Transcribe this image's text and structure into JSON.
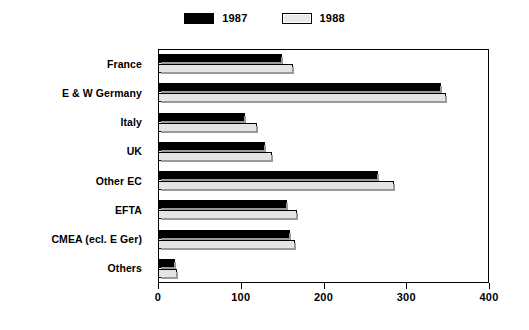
{
  "chart_data": {
    "type": "bar",
    "orientation": "horizontal",
    "title": "",
    "subtitle": "",
    "xlabel": "",
    "ylabel": "",
    "xlim": [
      0,
      400
    ],
    "xticks": [
      0,
      100,
      200,
      300,
      400
    ],
    "grid": false,
    "legend_position": "top-center",
    "categories": [
      "France",
      "E & W Germany",
      "Italy",
      "UK",
      "Other EC",
      "EFTA",
      "CMEA (ecl. E Ger)",
      "Others"
    ],
    "series": [
      {
        "name": "1987",
        "color": "#000000",
        "values": [
          150,
          342,
          105,
          129,
          266,
          156,
          160,
          21
        ]
      },
      {
        "name": "1988",
        "color": "#e4e4e4",
        "values": [
          163,
          348,
          120,
          138,
          285,
          168,
          166,
          23
        ]
      }
    ]
  },
  "legend": {
    "entries": [
      {
        "label": "1987",
        "swatch": "solid-black-swatch"
      },
      {
        "label": "1988",
        "swatch": "light-gray-swatch"
      }
    ]
  },
  "axis": {
    "x_tick_labels": [
      "0",
      "100",
      "200",
      "300",
      "400"
    ]
  }
}
